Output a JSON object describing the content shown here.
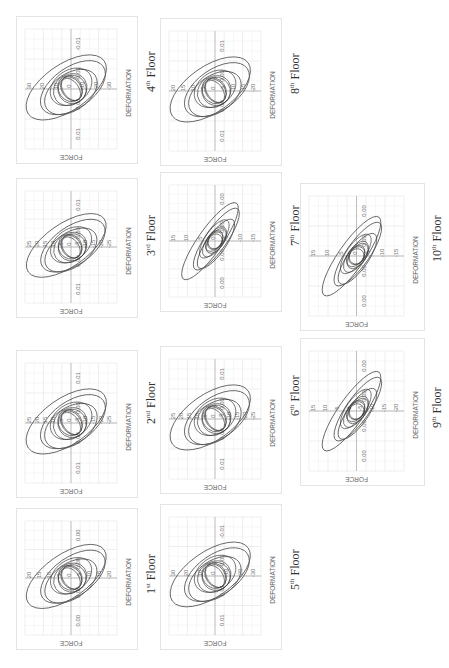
{
  "figure": {
    "orientation": "rotated-90-ccw",
    "panels": [
      {
        "id": "floor1",
        "floor_num": "1",
        "floor_sup": "st",
        "floor_word": "Floor",
        "x_ticks": [
          "0.00",
          "0.00",
          "0.00",
          "0.00"
        ],
        "y_ticks": [
          "20",
          "15",
          "10",
          "5",
          "0",
          "-5",
          "-10",
          "-15",
          "-20"
        ],
        "xlabel": "DEFORMATION",
        "ylabel": "FORCE"
      },
      {
        "id": "floor2",
        "floor_num": "2",
        "floor_sup": "nd",
        "floor_word": "Floor",
        "x_ticks": [
          "0.01",
          "0.00",
          "0.00",
          "0.01"
        ],
        "y_ticks": [
          "25",
          "20",
          "15",
          "10",
          "5",
          "0",
          "-5",
          "-10",
          "-15",
          "-20",
          "-25"
        ],
        "xlabel": "DEFORMATION",
        "ylabel": "FORCE"
      },
      {
        "id": "floor3",
        "floor_num": "3",
        "floor_sup": "rd",
        "floor_word": "Floor",
        "x_ticks": [
          "0.01",
          "0.00",
          "0.00",
          "0.01"
        ],
        "y_ticks": [
          "25",
          "20",
          "15",
          "10",
          "5",
          "0",
          "-5",
          "-10",
          "-15",
          "-20",
          "-25"
        ],
        "xlabel": "DEFORMATION",
        "ylabel": "FORCE"
      },
      {
        "id": "floor4",
        "floor_num": "4",
        "floor_sup": "th",
        "floor_word": "Floor",
        "x_ticks": [
          "-0.01",
          "-0.01",
          "0.01",
          "0.01"
        ],
        "y_ticks": [
          "30",
          "20",
          "10",
          "0",
          "-10",
          "-20",
          "-30"
        ],
        "xlabel": "DEFORMATION",
        "ylabel": "FORCE"
      },
      {
        "id": "floor5",
        "floor_num": "5",
        "floor_sup": "th",
        "floor_word": "Floor",
        "x_ticks": [
          "-0.01",
          "-0.01",
          "0.01",
          "0.01"
        ],
        "y_ticks": [
          "30",
          "20",
          "10",
          "0",
          "-10",
          "-20",
          "-30"
        ],
        "xlabel": "DEFORMATION",
        "ylabel": "FORCE"
      },
      {
        "id": "floor6",
        "floor_num": "6",
        "floor_sup": "th",
        "floor_word": "Floor",
        "x_ticks": [
          "0.01",
          "0.00",
          "0.00",
          "0.01"
        ],
        "y_ticks": [
          "25",
          "20",
          "15",
          "10",
          "5",
          "0",
          "-5",
          "-10",
          "-15",
          "-20",
          "-25"
        ],
        "xlabel": "DEFORMATION",
        "ylabel": "FORCE"
      },
      {
        "id": "floor7",
        "floor_num": "7",
        "floor_sup": "th",
        "floor_word": "Floor",
        "x_ticks": [
          "0.00",
          "0.00",
          "0.00",
          "0.00"
        ],
        "y_ticks": [
          "15",
          "10",
          "5",
          "0",
          "-5",
          "-10",
          "-15"
        ],
        "xlabel": "DEFORMATION",
        "ylabel": "FORCE"
      },
      {
        "id": "floor8",
        "floor_num": "8",
        "floor_sup": "th",
        "floor_word": "Floor",
        "x_ticks": [
          "0.01",
          "0.00",
          "0.00",
          "0.01"
        ],
        "y_ticks": [
          "20",
          "15",
          "10",
          "5",
          "0",
          "-5",
          "-10",
          "-15",
          "-20"
        ],
        "xlabel": "DEFORMATION",
        "ylabel": "FORCE"
      },
      {
        "id": "floor9",
        "floor_num": "9",
        "floor_sup": "th",
        "floor_word": "Floor",
        "x_ticks": [
          "0.00",
          "0.00",
          "0.00",
          "0.00"
        ],
        "y_ticks": [
          "15",
          "10",
          "5",
          "0",
          "-5",
          "-10",
          "-15",
          "-20"
        ],
        "xlabel": "DEFORMATION",
        "ylabel": "FORCE"
      },
      {
        "id": "floor10",
        "floor_num": "10",
        "floor_sup": "th",
        "floor_word": "Floor",
        "x_ticks": [
          "0.00",
          "0.00",
          "0.00",
          "0.00"
        ],
        "y_ticks": [
          "15",
          "10",
          "5",
          "0",
          "-5",
          "-10",
          "-15"
        ],
        "xlabel": "DEFORMATION",
        "ylabel": "FORCE"
      }
    ]
  },
  "chart_data": [
    {
      "type": "line",
      "title": "1st Floor",
      "xlabel": "DEFORMATION",
      "ylabel": "FORCE",
      "ylim": [
        -20,
        20
      ],
      "x_tick_labels": [
        "0.00",
        "0.00",
        "0.00",
        "0.00"
      ],
      "description": "hysteresis loops, force vs deformation"
    },
    {
      "type": "line",
      "title": "2nd Floor",
      "xlabel": "DEFORMATION",
      "ylabel": "FORCE",
      "ylim": [
        -25,
        25
      ],
      "x_tick_labels": [
        "0.01",
        "0.00",
        "0.00",
        "0.01"
      ],
      "description": "hysteresis loops, force vs deformation"
    },
    {
      "type": "line",
      "title": "3rd Floor",
      "xlabel": "DEFORMATION",
      "ylabel": "FORCE",
      "ylim": [
        -25,
        25
      ],
      "x_tick_labels": [
        "0.01",
        "0.00",
        "0.00",
        "0.01"
      ],
      "description": "hysteresis loops, force vs deformation"
    },
    {
      "type": "line",
      "title": "4th Floor",
      "xlabel": "DEFORMATION",
      "ylabel": "FORCE",
      "ylim": [
        -30,
        30
      ],
      "x_tick_labels": [
        "-0.01",
        "-0.01",
        "0.01",
        "0.01"
      ],
      "description": "hysteresis loops, force vs deformation"
    },
    {
      "type": "line",
      "title": "5th Floor",
      "xlabel": "DEFORMATION",
      "ylabel": "FORCE",
      "ylim": [
        -30,
        30
      ],
      "x_tick_labels": [
        "-0.01",
        "-0.01",
        "0.01",
        "0.01"
      ],
      "description": "hysteresis loops, force vs deformation"
    },
    {
      "type": "line",
      "title": "6th Floor",
      "xlabel": "DEFORMATION",
      "ylabel": "FORCE",
      "ylim": [
        -25,
        25
      ],
      "x_tick_labels": [
        "0.01",
        "0.00",
        "0.00",
        "0.01"
      ],
      "description": "hysteresis loops, force vs deformation"
    },
    {
      "type": "line",
      "title": "7th Floor",
      "xlabel": "DEFORMATION",
      "ylabel": "FORCE",
      "ylim": [
        -15,
        15
      ],
      "x_tick_labels": [
        "0.00",
        "0.00",
        "0.00",
        "0.00"
      ],
      "description": "hysteresis loops, force vs deformation"
    },
    {
      "type": "line",
      "title": "8th Floor",
      "xlabel": "DEFORMATION",
      "ylabel": "FORCE",
      "ylim": [
        -20,
        20
      ],
      "x_tick_labels": [
        "0.01",
        "0.00",
        "0.00",
        "0.01"
      ],
      "description": "hysteresis loops, force vs deformation"
    },
    {
      "type": "line",
      "title": "9th Floor",
      "xlabel": "DEFORMATION",
      "ylabel": "FORCE",
      "ylim": [
        -20,
        15
      ],
      "x_tick_labels": [
        "0.00",
        "0.00",
        "0.00",
        "0.00"
      ],
      "description": "hysteresis loops, force vs deformation"
    },
    {
      "type": "line",
      "title": "10th Floor",
      "xlabel": "DEFORMATION",
      "ylabel": "FORCE",
      "ylim": [
        -15,
        15
      ],
      "x_tick_labels": [
        "0.00",
        "0.00",
        "0.00",
        "0.00"
      ],
      "description": "hysteresis loops, force vs deformation"
    }
  ]
}
